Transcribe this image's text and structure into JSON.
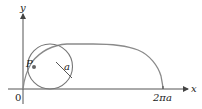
{
  "diagram": {
    "labels": {
      "y_axis": "y",
      "x_axis": "x",
      "origin": "0",
      "point": "P",
      "radius": "a",
      "x_tick": "2πa"
    },
    "colors": {
      "cycloid": "#888888",
      "circle": "#777777",
      "axes": "#444444",
      "point": "#666666",
      "text": "#222222"
    }
  }
}
